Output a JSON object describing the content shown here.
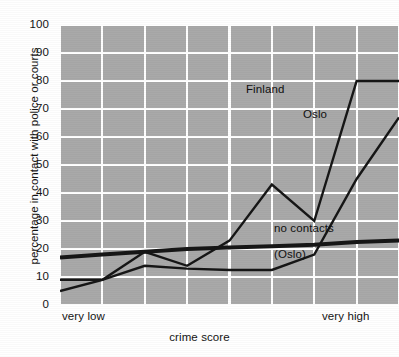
{
  "chart_data": {
    "type": "line",
    "title": "",
    "xlabel": "crime score",
    "ylabel": "percentage in contact with police or courts",
    "ylim": [
      0,
      100
    ],
    "ytick_values": [
      0,
      10,
      20,
      30,
      40,
      50,
      60,
      70,
      80,
      90,
      100
    ],
    "ytick_labels": [
      "0",
      "10",
      "20",
      "30",
      "40",
      "50",
      "60",
      "70",
      "80",
      "90",
      "100"
    ],
    "xlim": [
      0,
      8
    ],
    "x": [
      0,
      1,
      2,
      3,
      4,
      5,
      6,
      7,
      8
    ],
    "xtick_labels": [
      "very low",
      "",
      "",
      "",
      "",
      "",
      "",
      "",
      "very high"
    ],
    "grid": true,
    "grid_color": "#ffffff",
    "plot_background": "#a9a9a9",
    "line_color": "#161616",
    "legend": "inline-annotations",
    "series": [
      {
        "name": "Finland",
        "label_text": "Finland",
        "line_width": 2.4,
        "x": [
          0,
          1,
          2,
          3,
          4,
          5,
          6,
          7,
          8
        ],
        "values": [
          5,
          9,
          19,
          14,
          23,
          43,
          30,
          80,
          80
        ]
      },
      {
        "name": "Oslo",
        "label_text": "Oslo",
        "line_width": 2.4,
        "x": [
          0,
          1,
          2,
          3,
          4,
          5,
          6,
          7,
          8
        ],
        "values": [
          9,
          9,
          14,
          13,
          12.5,
          12.5,
          18,
          45,
          67
        ]
      },
      {
        "name": "no contacts (Oslo)",
        "label_text": "no contacts",
        "sublabel_text": "(Oslo)",
        "line_width": 4.0,
        "x": [
          0,
          1,
          2,
          3,
          4,
          5,
          6,
          7,
          8
        ],
        "values": [
          17,
          18,
          19,
          20,
          20.5,
          21,
          21.5,
          22.5,
          23
        ]
      }
    ],
    "annotations": [
      {
        "text": "Finland",
        "x": 246,
        "y": 83
      },
      {
        "text": "Oslo",
        "x": 303,
        "y": 108
      },
      {
        "text": "no contacts",
        "x": 274,
        "y": 222
      },
      {
        "text": "(Oslo)",
        "x": 274,
        "y": 248
      }
    ]
  }
}
